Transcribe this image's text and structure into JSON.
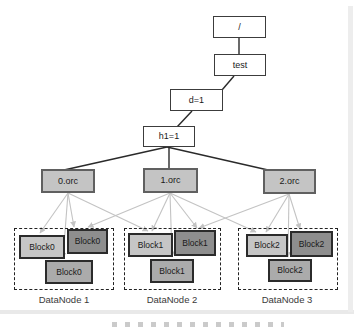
{
  "diagram": {
    "tree": {
      "nodes": [
        {
          "id": "root",
          "label": "/"
        },
        {
          "id": "test",
          "label": "test"
        },
        {
          "id": "d1",
          "label": "d=1"
        },
        {
          "id": "h1",
          "label": "h1=1"
        }
      ],
      "files": [
        {
          "id": "orc0",
          "label": "0.orc"
        },
        {
          "id": "orc1",
          "label": "1.orc"
        },
        {
          "id": "orc2",
          "label": "2.orc"
        }
      ]
    },
    "datanodes": [
      {
        "label": "DataNode 1",
        "blocks": [
          {
            "label": "Block0",
            "shade": "light"
          },
          {
            "label": "Block0",
            "shade": "dark"
          },
          {
            "label": "Block0",
            "shade": "medium"
          }
        ]
      },
      {
        "label": "DataNode 2",
        "blocks": [
          {
            "label": "Block1",
            "shade": "light"
          },
          {
            "label": "Block1",
            "shade": "dark"
          },
          {
            "label": "Block1",
            "shade": "medium"
          }
        ]
      },
      {
        "label": "DataNode 3",
        "blocks": [
          {
            "label": "Block2",
            "shade": "light"
          },
          {
            "label": "Block2",
            "shade": "dark"
          },
          {
            "label": "Block2",
            "shade": "medium"
          }
        ]
      }
    ],
    "colors": {
      "node_fill": "#ffffff",
      "node_border": "#3c3c3c",
      "file_fill": "#c4c4c4",
      "file_border": "#606060",
      "block_light": "#c6c6c6",
      "block_dark": "#8e8e8e",
      "block_medium": "#ababab",
      "block_border": "#2b2b2b",
      "tree_line": "#2a2a2a",
      "faint_line": "#c3c3c3",
      "datanode_border": "#222222",
      "text": "#1a1a1a"
    }
  }
}
